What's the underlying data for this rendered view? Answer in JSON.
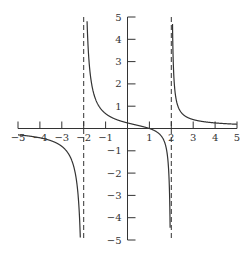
{
  "chart_data": {
    "type": "line",
    "title": "",
    "xlabel": "",
    "ylabel": "",
    "function": "f(x) = (x - 1) / (x^2 - 4)",
    "xlim": [
      -5,
      5
    ],
    "ylim": [
      -5,
      5
    ],
    "grid": false,
    "legend": null,
    "x_ticks": [
      -5,
      -4,
      -3,
      -2,
      -1,
      1,
      2,
      3,
      4,
      5
    ],
    "y_ticks": [
      -5,
      -4,
      -3,
      -2,
      -1,
      1,
      2,
      3,
      4,
      5
    ],
    "x_tick_labels": [
      "−5",
      "−4",
      "−3",
      "−2",
      "−1",
      "1",
      "2",
      "3",
      "4",
      "5"
    ],
    "y_tick_labels": [
      "−5",
      "−4",
      "−3",
      "−2",
      "−1",
      "1",
      "2",
      "3",
      "4",
      "5"
    ],
    "vertical_asymptotes": [
      -2,
      2
    ],
    "annotations": [
      "dashed vertical asymptotes at x = -2 and x = 2"
    ],
    "series": [
      {
        "name": "left branch (x < -2)",
        "x": [
          -5,
          -4.5,
          -4,
          -3.5,
          -3,
          -2.5,
          -2.3,
          -2.2,
          -2.1,
          -2.05
        ],
        "values": [
          -0.29,
          -0.34,
          -0.42,
          -0.55,
          -0.8,
          -1.56,
          -2.54,
          -3.81,
          -7.56,
          -14.8
        ]
      },
      {
        "name": "middle branch (-2 < x < 2)",
        "x": [
          -1.8,
          -1.5,
          -1,
          -0.5,
          0,
          0.5,
          1,
          1.5,
          1.8
        ],
        "values": [
          3.68,
          1.43,
          0.67,
          0.4,
          0.25,
          0.13,
          0,
          -0.29,
          -1.05
        ]
      },
      {
        "name": "right branch (x > 2)",
        "x": [
          2.05,
          2.1,
          2.2,
          2.5,
          3,
          3.5,
          4,
          4.5,
          5
        ],
        "values": [
          5.12,
          2.68,
          1.43,
          0.67,
          0.4,
          0.3,
          0.25,
          0.21,
          0.19
        ]
      }
    ]
  },
  "style": {
    "axis_color": "#333333",
    "curve_color": "#333333",
    "asymptote_color": "#333333",
    "background": "#ffffff"
  }
}
